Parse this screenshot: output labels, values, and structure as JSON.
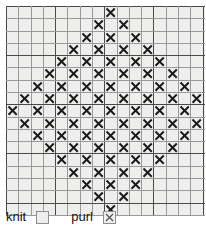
{
  "chart_data": {
    "type": "heatmap",
    "title": "",
    "xlabel": "",
    "ylabel": "",
    "rows": 17,
    "columns": 17,
    "grid_origin_row": "top",
    "cell_states": [
      "knit",
      "purl"
    ],
    "legend_position": "bottom-left",
    "grid": [
      [
        0,
        0,
        0,
        0,
        0,
        0,
        0,
        0,
        1,
        0,
        0,
        0,
        0,
        0,
        0,
        0,
        0
      ],
      [
        0,
        0,
        0,
        0,
        0,
        0,
        0,
        1,
        0,
        1,
        0,
        0,
        0,
        0,
        0,
        0,
        0
      ],
      [
        0,
        0,
        0,
        0,
        0,
        0,
        1,
        0,
        1,
        0,
        1,
        0,
        0,
        0,
        0,
        0,
        0
      ],
      [
        0,
        0,
        0,
        0,
        0,
        1,
        0,
        1,
        0,
        1,
        0,
        1,
        0,
        0,
        0,
        0,
        0
      ],
      [
        0,
        0,
        0,
        0,
        1,
        0,
        1,
        0,
        1,
        0,
        1,
        0,
        1,
        0,
        0,
        0,
        0
      ],
      [
        0,
        0,
        0,
        1,
        0,
        1,
        0,
        1,
        0,
        1,
        0,
        1,
        0,
        1,
        0,
        0,
        0
      ],
      [
        0,
        0,
        1,
        0,
        1,
        0,
        1,
        0,
        1,
        0,
        1,
        0,
        1,
        0,
        1,
        0,
        0
      ],
      [
        0,
        1,
        0,
        1,
        0,
        1,
        0,
        1,
        0,
        1,
        0,
        1,
        0,
        1,
        0,
        1,
        0
      ],
      [
        1,
        0,
        1,
        0,
        1,
        0,
        1,
        0,
        1,
        0,
        1,
        0,
        1,
        0,
        1,
        0,
        1
      ],
      [
        0,
        1,
        0,
        1,
        0,
        1,
        0,
        1,
        0,
        1,
        0,
        1,
        0,
        1,
        0,
        1,
        0
      ],
      [
        0,
        0,
        1,
        0,
        1,
        0,
        1,
        0,
        1,
        0,
        1,
        0,
        1,
        0,
        1,
        0,
        0
      ],
      [
        0,
        0,
        0,
        1,
        0,
        1,
        0,
        1,
        0,
        1,
        0,
        1,
        0,
        1,
        0,
        0,
        0
      ],
      [
        0,
        0,
        0,
        0,
        1,
        0,
        1,
        0,
        1,
        0,
        1,
        0,
        1,
        0,
        0,
        0,
        0
      ],
      [
        0,
        0,
        0,
        0,
        0,
        1,
        0,
        1,
        0,
        1,
        0,
        1,
        0,
        0,
        0,
        0,
        0
      ],
      [
        0,
        0,
        0,
        0,
        0,
        0,
        1,
        0,
        1,
        0,
        1,
        0,
        0,
        0,
        0,
        0,
        0
      ],
      [
        0,
        0,
        0,
        0,
        0,
        0,
        0,
        1,
        0,
        1,
        0,
        0,
        0,
        0,
        0,
        0,
        0
      ],
      [
        0,
        0,
        0,
        0,
        0,
        0,
        0,
        0,
        1,
        0,
        0,
        0,
        0,
        0,
        0,
        0,
        0
      ]
    ],
    "symbols": {
      "0": "",
      "1": "X"
    },
    "colors": {
      "cell_background": "#eeeeec",
      "grid_line_light": "#9a9a9a",
      "grid_line_heavy": "#4a4a4a",
      "symbol": "#1a1a1a",
      "page_background": "#ffffff",
      "text": "#111111"
    }
  },
  "legend": {
    "knit": {
      "label": "knit",
      "symbol": ""
    },
    "purl": {
      "label": "purl",
      "symbol": "X"
    }
  }
}
